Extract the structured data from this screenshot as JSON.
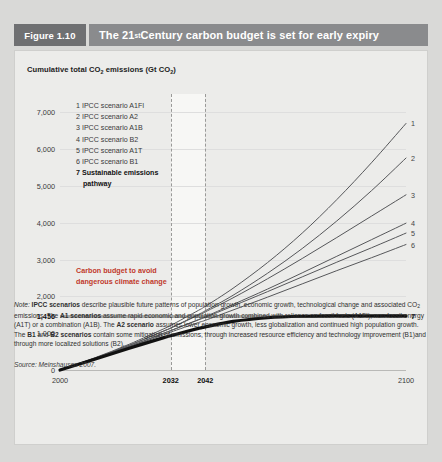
{
  "header": {
    "figure_tag": "Figure 1.10",
    "title_pre": "The 21",
    "title_sup": "st",
    "title_post": " Century carbon budget is set for early expiry"
  },
  "axis_title": {
    "pre": "Cumulative total CO",
    "sub1": "2",
    "mid": " emissions (Gt CO",
    "sub2": "2",
    "post": ")"
  },
  "legend": {
    "items": [
      "1 IPCC scenario A1FI",
      "2 IPCC scenario A2",
      "3 IPCC scenario A1B",
      "4 IPCC scenario B2",
      "5 IPCC scenario A1T",
      "6 IPCC scenario B1"
    ],
    "highlight_line1": "7 Sustainable emissions",
    "highlight_line2": "pathway"
  },
  "annotation": {
    "line1": "Carbon budget to avoid",
    "line2": "dangerous climate change",
    "color": "#c0392b"
  },
  "note": {
    "label": "Note:",
    "b1": "IPCC scenarios",
    "t1": " describe plausible future patterns of population growth, economic growth, technological change and associated CO",
    "sub1": "2",
    "t2": " emissions. The ",
    "b2": "A1 scenarios",
    "t3": " assume rapid economic and population growth combined with reliance on fossil fuels (A1FI), non-fossil energy (A1T) or a combination (A1B). The ",
    "b3": "A2 scenario",
    "t4": " assumes lower economic growth, less globalization and continued high population growth. The ",
    "b4": "B1",
    "t5": " and ",
    "b5": "B2 scenarios",
    "t6": " contain some mitigation of emissions, through increased resource efficiency and technology improvement (B1)and through more localized solutions (B2)."
  },
  "source": {
    "label": "Source:",
    "text": " Meinshausen 2007."
  },
  "chart_data": {
    "type": "line",
    "title": "The 21st Century carbon budget is set for early expiry",
    "xlabel": "",
    "ylabel": "Cumulative total CO2 emissions (Gt CO2)",
    "xlim": [
      2000,
      2100
    ],
    "ylim": [
      0,
      7500
    ],
    "grid": true,
    "legend_position": "inside-upper-left",
    "y_ticks": [
      {
        "value": 7000,
        "label": "7,000",
        "bold": false
      },
      {
        "value": 6000,
        "label": "6,000",
        "bold": false
      },
      {
        "value": 5000,
        "label": "5,000",
        "bold": false
      },
      {
        "value": 4000,
        "label": "4,000",
        "bold": false
      },
      {
        "value": 3000,
        "label": "3,000",
        "bold": false
      },
      {
        "value": 2000,
        "label": "2,000",
        "bold": false
      },
      {
        "value": 1456,
        "label": "1,456",
        "bold": true
      },
      {
        "value": 1000,
        "label": "1,000",
        "bold": false
      },
      {
        "value": 0,
        "label": "0",
        "bold": false
      }
    ],
    "x_ticks": [
      {
        "value": 2000,
        "label": "2000",
        "bold": false
      },
      {
        "value": 2032,
        "label": "2032",
        "bold": true
      },
      {
        "value": 2042,
        "label": "2042",
        "bold": true
      },
      {
        "value": 2100,
        "label": "2100",
        "bold": false
      }
    ],
    "annotations": [
      {
        "type": "hline",
        "value": 1456,
        "label": "Carbon budget to avoid dangerous climate change",
        "color": "#a9a9a7"
      },
      {
        "type": "vline",
        "value": 2032,
        "style": "dashed"
      },
      {
        "type": "vline",
        "value": 2042,
        "style": "dashed"
      },
      {
        "type": "band",
        "x0": 2032,
        "x1": 2042,
        "color": "#f7f7f5"
      }
    ],
    "x": [
      2000,
      2010,
      2020,
      2030,
      2032,
      2040,
      2042,
      2050,
      2060,
      2070,
      2080,
      2090,
      2100
    ],
    "series": [
      {
        "name": "1 IPCC scenario A1FI",
        "end_label": "1",
        "values": [
          0,
          330,
          700,
          1120,
          1210,
          1620,
          1730,
          2220,
          2920,
          3720,
          4630,
          5630,
          6700
        ]
      },
      {
        "name": "2 IPCC scenario A2",
        "end_label": "2",
        "values": [
          0,
          320,
          670,
          1060,
          1140,
          1510,
          1610,
          2030,
          2630,
          3300,
          4050,
          4870,
          5760
        ]
      },
      {
        "name": "3 IPCC scenario A1B",
        "end_label": "3",
        "values": [
          0,
          320,
          670,
          1060,
          1140,
          1490,
          1580,
          1960,
          2480,
          3030,
          3600,
          4180,
          4760
        ]
      },
      {
        "name": "4 IPCC scenario B2",
        "end_label": "4",
        "values": [
          0,
          310,
          640,
          1000,
          1070,
          1370,
          1450,
          1780,
          2200,
          2640,
          3090,
          3540,
          3990
        ]
      },
      {
        "name": "5 IPCC scenario A1T",
        "end_label": "5",
        "values": [
          0,
          310,
          640,
          1000,
          1070,
          1360,
          1430,
          1740,
          2130,
          2530,
          2930,
          3320,
          3720
        ]
      },
      {
        "name": "6 IPCC scenario B1",
        "end_label": "6",
        "values": [
          0,
          300,
          620,
          960,
          1030,
          1290,
          1350,
          1630,
          1980,
          2340,
          2700,
          3050,
          3410
        ]
      },
      {
        "name": "7 Sustainable emissions pathway",
        "end_label": "7",
        "emphasis": true,
        "values": [
          0,
          290,
          590,
          880,
          930,
          1130,
          1170,
          1320,
          1420,
          1460,
          1470,
          1470,
          1470
        ]
      }
    ]
  }
}
